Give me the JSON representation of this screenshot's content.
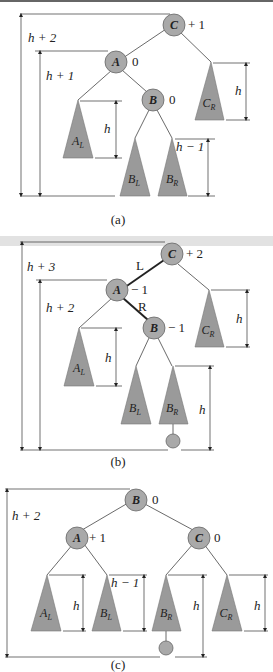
{
  "panels": [
    {
      "id": "a",
      "caption": "(a)",
      "nodes": [
        {
          "label": "C",
          "balance": "+ 1"
        },
        {
          "label": "A",
          "balance": "0"
        },
        {
          "label": "B",
          "balance": "0"
        }
      ],
      "subtrees": [
        {
          "label": "A",
          "sub": "L",
          "height": "h"
        },
        {
          "label": "B",
          "sub": "L"
        },
        {
          "label": "B",
          "sub": "R",
          "height": "h − 1"
        },
        {
          "label": "C",
          "sub": "R",
          "height": "h"
        }
      ],
      "heights": {
        "outer": "h + 2",
        "inner": "h + 1"
      }
    },
    {
      "id": "b",
      "caption": "(b)",
      "nodes": [
        {
          "label": "C",
          "balance": "+ 2"
        },
        {
          "label": "A",
          "balance": "− 1"
        },
        {
          "label": "B",
          "balance": "− 1"
        }
      ],
      "edge_labels": {
        "left": "L",
        "right": "R"
      },
      "subtrees": [
        {
          "label": "A",
          "sub": "L",
          "height": "h"
        },
        {
          "label": "B",
          "sub": "L"
        },
        {
          "label": "B",
          "sub": "R",
          "height": "h"
        },
        {
          "label": "C",
          "sub": "R",
          "height": "h"
        }
      ],
      "heights": {
        "outer": "h + 3",
        "inner": "h + 2"
      }
    },
    {
      "id": "c",
      "caption": "(c)",
      "nodes": [
        {
          "label": "B",
          "balance": "0"
        },
        {
          "label": "A",
          "balance": "+ 1"
        },
        {
          "label": "C",
          "balance": "0"
        }
      ],
      "subtrees": [
        {
          "label": "A",
          "sub": "L",
          "height": "h"
        },
        {
          "label": "B",
          "sub": "L",
          "height": "h − 1"
        },
        {
          "label": "B",
          "sub": "R",
          "height": "h"
        },
        {
          "label": "C",
          "sub": "R",
          "height": "h"
        }
      ],
      "heights": {
        "outer": "h + 2"
      }
    }
  ],
  "colors": {
    "node_fill": "#a9a9a9",
    "subtree_fill": "#9a9a9a",
    "line": "#333333"
  }
}
